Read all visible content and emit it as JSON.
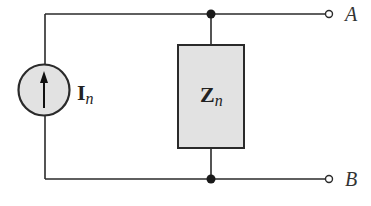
{
  "diagram": {
    "type": "norton-equivalent-circuit",
    "source": {
      "symbol": "I",
      "subscript": "n",
      "kind": "current-source",
      "direction": "up"
    },
    "impedance": {
      "symbol": "Z",
      "subscript": "n"
    },
    "terminals": [
      {
        "label": "A"
      },
      {
        "label": "B"
      }
    ],
    "colors": {
      "wire": "#2a2a2a",
      "fill": "#e2e2e2",
      "background": "#ffffff"
    }
  }
}
